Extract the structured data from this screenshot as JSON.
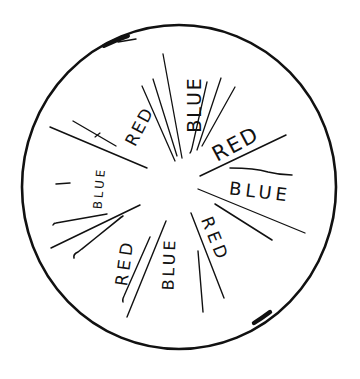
{
  "figure": {
    "type": "hand-drawn radial wheel sketch",
    "stroke_color": "#111111",
    "background_color": "#ffffff"
  },
  "sectors": [
    {
      "label": "RED",
      "position": "upper-left"
    },
    {
      "label": "BLUE",
      "position": "top"
    },
    {
      "label": "RED",
      "position": "upper-right"
    },
    {
      "label": "BLUE",
      "position": "right"
    },
    {
      "label": "RED",
      "position": "lower-right"
    },
    {
      "label": "BLUE",
      "position": "bottom"
    },
    {
      "label": "RED",
      "position": "lower-left"
    },
    {
      "label": "BLUE",
      "position": "left"
    }
  ],
  "pattern": [
    "RED",
    "BLUE",
    "RED",
    "BLUE",
    "RED",
    "BLUE",
    "RED",
    "BLUE"
  ]
}
